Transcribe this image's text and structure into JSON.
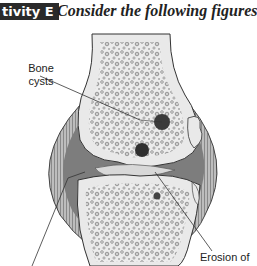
{
  "header": {
    "activity_badge": "tivity E",
    "instruction": "Consider the following figures."
  },
  "figure": {
    "labels": {
      "bone_cysts_line1": "Bone",
      "bone_cysts_line2": "cysts",
      "erosion": "Erosion of"
    },
    "colors": {
      "bone_fill": "#e8e8e8",
      "trabecular": "#9a9a9a",
      "capsule": "#6e6e6e",
      "cavity": "#7a7a7a",
      "cyst": "#3a3a3a",
      "badge_bg": "#2a2a2a"
    }
  }
}
